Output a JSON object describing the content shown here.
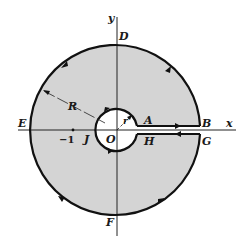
{
  "diagram": {
    "type": "keyhole-contour",
    "colors": {
      "fill": "#d4d4d4",
      "stroke": "#111111",
      "background": "#ffffff"
    },
    "axes": {
      "x_label": "x",
      "y_label": "y"
    },
    "origin_label": "O",
    "tick": {
      "label": "−1"
    },
    "outer_radius_label": "R",
    "inner_radius_label": "r",
    "points": {
      "A": "A",
      "B": "B",
      "D": "D",
      "E": "E",
      "F": "F",
      "G": "G",
      "H": "H",
      "J": "J"
    }
  }
}
